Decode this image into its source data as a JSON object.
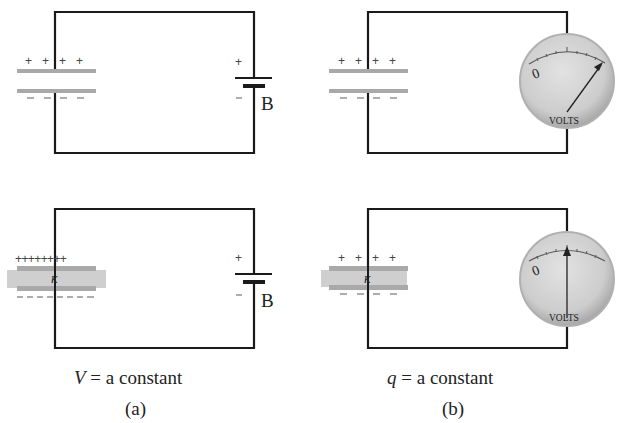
{
  "figure": {
    "panels": [
      {
        "id": "a",
        "label": "(a)",
        "condition_var": "V",
        "condition_text": "= a constant",
        "top_circuit": {
          "capacitor": {
            "plus_signs": "+ + + +",
            "minus_signs": "– – – –",
            "dielectric": false
          },
          "source": {
            "type": "battery",
            "label": "B",
            "plus": "+",
            "minus": "–"
          }
        },
        "bottom_circuit": {
          "capacitor": {
            "plus_signs": "++++++++",
            "minus_signs": "– – – – – – – –",
            "dielectric": true,
            "dielectric_label": "κ"
          },
          "source": {
            "type": "battery",
            "label": "B",
            "plus": "+",
            "minus": "–"
          }
        }
      },
      {
        "id": "b",
        "label": "(b)",
        "condition_var": "q",
        "condition_text": "= a constant",
        "top_circuit": {
          "capacitor": {
            "plus_signs": "+ + + +",
            "minus_signs": "– – – –",
            "dielectric": false
          },
          "meter": {
            "type": "voltmeter",
            "unit_label": "VOLTS",
            "zero_label": "0",
            "needle": "high"
          }
        },
        "bottom_circuit": {
          "capacitor": {
            "plus_signs": "+ + + +",
            "minus_signs": "– – – –",
            "dielectric": true,
            "dielectric_label": "κ"
          },
          "meter": {
            "type": "voltmeter",
            "unit_label": "VOLTS",
            "zero_label": "0",
            "needle": "middle"
          }
        }
      }
    ],
    "colors": {
      "wire": "#1a1a1a",
      "plate": "#a9a9a9",
      "dielectric": "#cfcfcf",
      "meter_face": "#d6d6d6",
      "meter_rim": "#b5b5b5"
    }
  }
}
